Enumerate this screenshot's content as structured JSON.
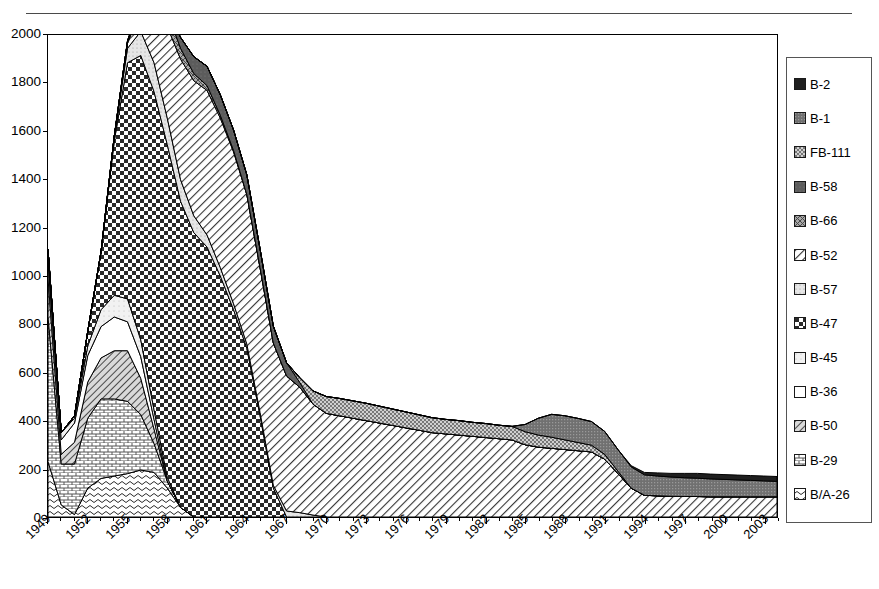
{
  "chart_data": {
    "type": "area",
    "stacked": true,
    "title": "",
    "subtitle": "",
    "xlabel": "",
    "ylabel": "",
    "ylim": [
      0,
      2000
    ],
    "ytick_step": 200,
    "ytick_labels": [
      "0",
      "200",
      "400",
      "600",
      "800",
      "1000",
      "1200",
      "1400",
      "1600",
      "1800",
      "2000"
    ],
    "grid": false,
    "legend_position": "right",
    "x_start": 1949,
    "x_end": 2004,
    "xtick_label_interval": 3,
    "xtick_labels": [
      "1949",
      "1952",
      "1955",
      "1958",
      "1961",
      "1964",
      "1967",
      "1970",
      "1973",
      "1976",
      "1979",
      "1982",
      "1985",
      "1988",
      "1991",
      "1994",
      "1997",
      "2000",
      "2003"
    ],
    "x": [
      1949,
      1950,
      1951,
      1952,
      1953,
      1954,
      1955,
      1956,
      1957,
      1958,
      1959,
      1960,
      1961,
      1962,
      1963,
      1964,
      1965,
      1966,
      1967,
      1968,
      1969,
      1970,
      1971,
      1972,
      1973,
      1974,
      1975,
      1976,
      1977,
      1978,
      1979,
      1980,
      1981,
      1982,
      1983,
      1984,
      1985,
      1986,
      1987,
      1988,
      1989,
      1990,
      1991,
      1992,
      1993,
      1994,
      1995,
      1996,
      1997,
      1998,
      1999,
      2000,
      2001,
      2002,
      2003,
      2004
    ],
    "stack_order_bottom_to_top": [
      "B/A-26",
      "B-29",
      "B-50",
      "B-36",
      "B-45",
      "B-47",
      "B-57",
      "B-52",
      "B-66",
      "B-58",
      "FB-111",
      "B-1",
      "B-2"
    ],
    "series": [
      {
        "name": "B-2",
        "fill": "#1c1c1c",
        "values": [
          0,
          0,
          0,
          0,
          0,
          0,
          0,
          0,
          0,
          0,
          0,
          0,
          0,
          0,
          0,
          0,
          0,
          0,
          0,
          0,
          0,
          0,
          0,
          0,
          0,
          0,
          0,
          0,
          0,
          0,
          0,
          0,
          0,
          0,
          0,
          0,
          0,
          0,
          0,
          0,
          0,
          0,
          0,
          0,
          5,
          10,
          13,
          15,
          18,
          20,
          20,
          20,
          20,
          20,
          20,
          20
        ]
      },
      {
        "name": "B-1",
        "fill": "#6e6e6e",
        "values": [
          0,
          0,
          0,
          0,
          0,
          0,
          0,
          0,
          0,
          0,
          0,
          0,
          0,
          0,
          0,
          0,
          0,
          0,
          0,
          0,
          0,
          0,
          0,
          0,
          0,
          0,
          0,
          0,
          0,
          0,
          0,
          0,
          0,
          0,
          0,
          0,
          30,
          70,
          95,
          100,
          100,
          98,
          95,
          90,
          88,
          85,
          82,
          80,
          78,
          76,
          74,
          72,
          70,
          68,
          66,
          64
        ]
      },
      {
        "name": "FB-111",
        "fill": "#c9c9c9",
        "values": [
          0,
          0,
          0,
          0,
          0,
          0,
          0,
          0,
          0,
          0,
          0,
          0,
          0,
          0,
          0,
          0,
          0,
          0,
          0,
          20,
          55,
          70,
          72,
          72,
          72,
          70,
          68,
          66,
          64,
          62,
          60,
          60,
          58,
          58,
          56,
          56,
          54,
          50,
          46,
          40,
          34,
          28,
          20,
          10,
          0,
          0,
          0,
          0,
          0,
          0,
          0,
          0,
          0,
          0,
          0,
          0
        ]
      },
      {
        "name": "B-58",
        "fill": "#545454",
        "values": [
          0,
          0,
          0,
          0,
          0,
          0,
          0,
          0,
          0,
          10,
          45,
          70,
          80,
          85,
          85,
          82,
          78,
          70,
          55,
          20,
          0,
          0,
          0,
          0,
          0,
          0,
          0,
          0,
          0,
          0,
          0,
          0,
          0,
          0,
          0,
          0,
          0,
          0,
          0,
          0,
          0,
          0,
          0,
          0,
          0,
          0,
          0,
          0,
          0,
          0,
          0,
          0,
          0,
          0,
          0,
          0
        ]
      },
      {
        "name": "B-66",
        "fill": "#8a8a8a",
        "values": [
          0,
          0,
          0,
          0,
          0,
          0,
          10,
          30,
          55,
          60,
          45,
          30,
          20,
          12,
          6,
          0,
          0,
          0,
          0,
          0,
          0,
          0,
          0,
          0,
          0,
          0,
          0,
          0,
          0,
          0,
          0,
          0,
          0,
          0,
          0,
          0,
          0,
          0,
          0,
          0,
          0,
          0,
          0,
          0,
          0,
          0,
          0,
          0,
          0,
          0,
          0,
          0,
          0,
          0,
          0,
          0
        ]
      },
      {
        "name": "B-52",
        "fill": "#ffffff",
        "values": [
          0,
          0,
          0,
          0,
          0,
          0,
          20,
          90,
          240,
          380,
          500,
          560,
          600,
          620,
          630,
          620,
          600,
          590,
          560,
          520,
          460,
          430,
          420,
          410,
          400,
          390,
          380,
          370,
          360,
          350,
          345,
          340,
          335,
          330,
          325,
          320,
          300,
          290,
          285,
          280,
          275,
          270,
          240,
          180,
          120,
          90,
          88,
          86,
          85,
          85,
          84,
          84,
          84,
          84,
          84,
          84
        ]
      },
      {
        "name": "B-57",
        "fill": "#e3e3e3",
        "values": [
          0,
          0,
          0,
          0,
          0,
          20,
          60,
          100,
          120,
          110,
          90,
          70,
          50,
          35,
          25,
          18,
          14,
          12,
          25,
          18,
          8,
          0,
          0,
          0,
          0,
          0,
          0,
          0,
          0,
          0,
          0,
          0,
          0,
          0,
          0,
          0,
          0,
          0,
          0,
          0,
          0,
          0,
          0,
          0,
          0,
          0,
          0,
          0,
          0,
          0,
          0,
          0,
          0,
          0,
          0,
          0
        ]
      },
      {
        "name": "B-47",
        "fill": "#3d3d3d",
        "values": [
          0,
          0,
          10,
          60,
          240,
          640,
          980,
          1180,
          1320,
          1380,
          1270,
          1180,
          1120,
          1000,
          860,
          700,
          420,
          120,
          0,
          0,
          0,
          0,
          0,
          0,
          0,
          0,
          0,
          0,
          0,
          0,
          0,
          0,
          0,
          0,
          0,
          0,
          0,
          0,
          0,
          0,
          0,
          0,
          0,
          0,
          0,
          0,
          0,
          0,
          0,
          0,
          0,
          0,
          0,
          0,
          0,
          0
        ]
      },
      {
        "name": "B-45",
        "fill": "#ededed",
        "values": [
          60,
          30,
          20,
          40,
          70,
          90,
          95,
          70,
          40,
          15,
          0,
          0,
          0,
          0,
          0,
          0,
          0,
          0,
          0,
          0,
          0,
          0,
          0,
          0,
          0,
          0,
          0,
          0,
          0,
          0,
          0,
          0,
          0,
          0,
          0,
          0,
          0,
          0,
          0,
          0,
          0,
          0,
          0,
          0,
          0,
          0,
          0,
          0,
          0,
          0,
          0,
          0,
          0,
          0,
          0,
          0
        ]
      },
      {
        "name": "B-36",
        "fill": "#ffffff",
        "values": [
          60,
          60,
          80,
          110,
          130,
          140,
          120,
          90,
          40,
          0,
          0,
          0,
          0,
          0,
          0,
          0,
          0,
          0,
          0,
          0,
          0,
          0,
          0,
          0,
          0,
          0,
          0,
          0,
          0,
          0,
          0,
          0,
          0,
          0,
          0,
          0,
          0,
          0,
          0,
          0,
          0,
          0,
          0,
          0,
          0,
          0,
          0,
          0,
          0,
          0,
          0,
          0,
          0,
          0,
          0,
          0
        ]
      },
      {
        "name": "B-50",
        "fill": "#b4b4b4",
        "values": [
          160,
          40,
          90,
          150,
          170,
          200,
          210,
          150,
          60,
          0,
          0,
          0,
          0,
          0,
          0,
          0,
          0,
          0,
          0,
          0,
          0,
          0,
          0,
          0,
          0,
          0,
          0,
          0,
          0,
          0,
          0,
          0,
          0,
          0,
          0,
          0,
          0,
          0,
          0,
          0,
          0,
          0,
          0,
          0,
          0,
          0,
          0,
          0,
          0,
          0,
          0,
          0,
          0,
          0,
          0,
          0
        ]
      },
      {
        "name": "B-29",
        "fill": "#dcdcdc",
        "values": [
          600,
          170,
          210,
          290,
          330,
          320,
          300,
          230,
          120,
          30,
          0,
          0,
          0,
          0,
          0,
          0,
          0,
          0,
          0,
          0,
          0,
          0,
          0,
          0,
          0,
          0,
          0,
          0,
          0,
          0,
          0,
          0,
          0,
          0,
          0,
          0,
          0,
          0,
          0,
          0,
          0,
          0,
          0,
          0,
          0,
          0,
          0,
          0,
          0,
          0,
          0,
          0,
          0,
          0,
          0,
          0
        ]
      },
      {
        "name": "B/A-26",
        "fill": "#d2d2d2",
        "values": [
          230,
          50,
          10,
          120,
          160,
          170,
          180,
          195,
          185,
          120,
          40,
          0,
          0,
          0,
          0,
          0,
          0,
          0,
          0,
          0,
          0,
          0,
          0,
          0,
          0,
          0,
          0,
          0,
          0,
          0,
          0,
          0,
          0,
          0,
          0,
          0,
          0,
          0,
          0,
          0,
          0,
          0,
          0,
          0,
          0,
          0,
          0,
          0,
          0,
          0,
          0,
          0,
          0,
          0,
          0,
          0
        ]
      }
    ]
  },
  "legend": {
    "items": [
      {
        "label": "B-2",
        "pattern": "solid-dark"
      },
      {
        "label": "B-1",
        "pattern": "fine-dots-gray"
      },
      {
        "label": "FB-111",
        "pattern": "speckle-light"
      },
      {
        "label": "B-58",
        "pattern": "solid-mid-gray"
      },
      {
        "label": "B-66",
        "pattern": "cross-gray"
      },
      {
        "label": "B-52",
        "pattern": "diagonal-hatch"
      },
      {
        "label": "B-57",
        "pattern": "light-speckle"
      },
      {
        "label": "B-47",
        "pattern": "checkerboard"
      },
      {
        "label": "B-45",
        "pattern": "very-light"
      },
      {
        "label": "B-36",
        "pattern": "white"
      },
      {
        "label": "B-50",
        "pattern": "diagonal-gray"
      },
      {
        "label": "B-29",
        "pattern": "brick"
      },
      {
        "label": "B/A-26",
        "pattern": "wavy"
      }
    ]
  }
}
